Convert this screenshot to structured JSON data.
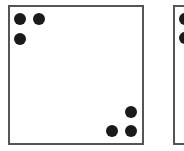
{
  "diagram": {
    "colors": {
      "background": "#ffffff",
      "border": "#555555",
      "dot": "#1a1a1a"
    },
    "dot_diameter": 12,
    "panels": [
      {
        "id": "panel-1",
        "x": 8,
        "y": 5,
        "width": 136,
        "height": 140,
        "dot_count": 6,
        "dots": [
          {
            "cx": 20,
            "cy": 19
          },
          {
            "cx": 39,
            "cy": 19
          },
          {
            "cx": 20,
            "cy": 39
          },
          {
            "cx": 131,
            "cy": 112
          },
          {
            "cx": 112,
            "cy": 131
          },
          {
            "cx": 131,
            "cy": 131
          }
        ]
      },
      {
        "id": "panel-2",
        "x": 173,
        "y": 5,
        "width": 136,
        "height": 140,
        "dot_count_visible": 2,
        "dots": [
          {
            "cx": 185,
            "cy": 19
          },
          {
            "cx": 185,
            "cy": 38
          }
        ]
      }
    ]
  }
}
